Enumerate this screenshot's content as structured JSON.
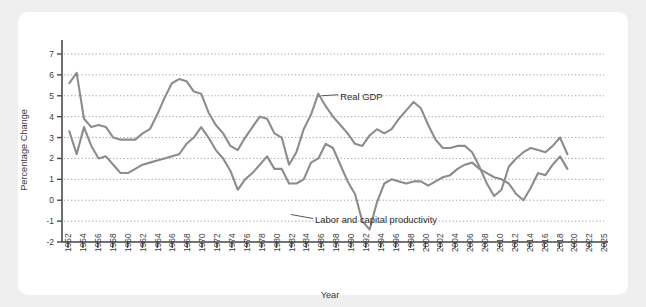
{
  "chart_data": {
    "type": "line",
    "title": "",
    "xlabel": "Year",
    "ylabel": "Percentage Change",
    "xlim": [
      1951,
      2025
    ],
    "ylim": [
      -2,
      7
    ],
    "ytick_values": [
      -2,
      -1,
      0,
      1,
      2,
      3,
      4,
      5,
      6,
      7
    ],
    "ytick_labels": [
      "-2",
      "-1",
      "0",
      "1",
      "2",
      "3",
      "4",
      "5",
      "6",
      "7"
    ],
    "xtick_labels": [
      "1952",
      "1954",
      "1956",
      "1958",
      "1960",
      "1962",
      "1964",
      "1966",
      "1968",
      "1970",
      "1972",
      "1974",
      "1976",
      "1978",
      "1980",
      "1982",
      "1984",
      "1986",
      "1988",
      "1990",
      "1992",
      "1994",
      "1996",
      "1998",
      "2000",
      "2002",
      "2004",
      "2006",
      "2008",
      "2010",
      "2012",
      "2014",
      "2016",
      "2018",
      "2020",
      "2022",
      "2025"
    ],
    "grid": "horizontal-dotted",
    "legend": "annotations-inline",
    "line_color": "#8c8c8c",
    "x": [
      1952,
      1953,
      1954,
      1955,
      1956,
      1957,
      1958,
      1959,
      1960,
      1961,
      1962,
      1963,
      1964,
      1965,
      1966,
      1967,
      1968,
      1969,
      1970,
      1971,
      1972,
      1973,
      1974,
      1975,
      1976,
      1977,
      1978,
      1979,
      1980,
      1981,
      1982,
      1983,
      1984,
      1985,
      1986,
      1987,
      1988,
      1989,
      1990,
      1991,
      1992,
      1993,
      1994,
      1995,
      1996,
      1997,
      1998,
      1999,
      2000,
      2001,
      2002,
      2003,
      2004,
      2005,
      2006,
      2007,
      2008,
      2009,
      2010,
      2011,
      2012,
      2013,
      2014,
      2015,
      2016,
      2017,
      2018,
      2019,
      2020
    ],
    "series": [
      {
        "name": "Real GDP",
        "values": [
          5.6,
          6.1,
          3.9,
          3.5,
          3.6,
          3.5,
          3.0,
          2.9,
          2.9,
          2.9,
          3.2,
          3.4,
          4.1,
          4.9,
          5.6,
          5.8,
          5.7,
          5.2,
          5.1,
          4.2,
          3.6,
          3.2,
          2.6,
          2.4,
          3.0,
          3.5,
          4.0,
          3.9,
          3.2,
          3.0,
          1.7,
          2.3,
          3.4,
          4.1,
          5.1,
          4.5,
          4.0,
          3.6,
          3.2,
          2.7,
          2.6,
          3.1,
          3.4,
          3.2,
          3.4,
          3.9,
          4.3,
          4.7,
          4.4,
          3.6,
          2.9,
          2.5,
          2.5,
          2.6,
          2.6,
          2.3,
          1.6,
          0.8,
          0.2,
          0.5,
          1.6,
          2.0,
          2.3,
          2.5,
          2.4,
          2.3,
          2.6,
          3.0,
          2.2
        ],
        "annotation": "Real GDP",
        "annotation_at": {
          "x": 1986,
          "y": 5.1
        }
      },
      {
        "name": "Labor and capital productivity",
        "values": [
          3.3,
          2.2,
          3.5,
          2.6,
          2.0,
          2.1,
          1.7,
          1.3,
          1.3,
          1.5,
          1.7,
          1.8,
          1.9,
          2.0,
          2.1,
          2.2,
          2.7,
          3.0,
          3.5,
          3.0,
          2.4,
          2.0,
          1.4,
          0.5,
          1.0,
          1.3,
          1.7,
          2.1,
          1.5,
          1.5,
          0.8,
          0.8,
          1.0,
          1.8,
          2.0,
          2.7,
          2.5,
          1.7,
          0.9,
          0.3,
          -1.0,
          -1.4,
          -0.1,
          0.8,
          1.0,
          0.9,
          0.8,
          0.9,
          0.9,
          0.7,
          0.9,
          1.1,
          1.2,
          1.5,
          1.7,
          1.8,
          1.5,
          1.3,
          1.1,
          1.0,
          0.8,
          0.3,
          0.0,
          0.6,
          1.3,
          1.2,
          1.7,
          2.1,
          1.5
        ],
        "annotation": "Labor and capital productivity",
        "annotation_at": {
          "x": 1982,
          "y": -0.4
        }
      }
    ]
  },
  "labels": {
    "y_axis": "Percentage Change",
    "x_axis": "Year",
    "annotation_gdp": "Real GDP",
    "annotation_productivity": "Labor and capital productivity"
  }
}
